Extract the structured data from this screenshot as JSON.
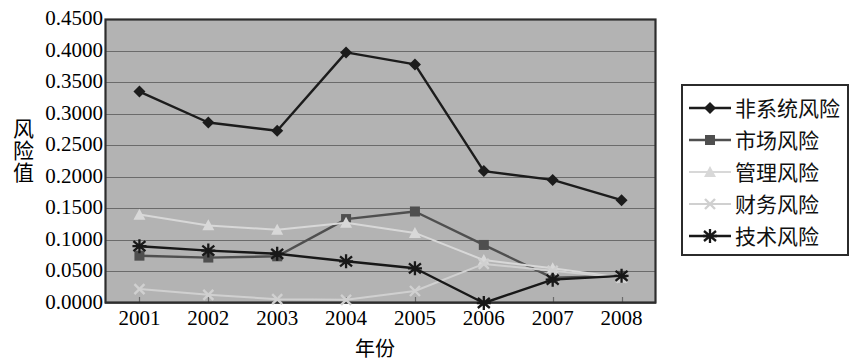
{
  "axes": {
    "y_label": "风险值",
    "x_label": "年份",
    "y_ticks": [
      "0.4500",
      "0.4000",
      "0.3500",
      "0.3000",
      "0.2500",
      "0.2000",
      "0.1500",
      "0.1000",
      "0.0500",
      "0.0000"
    ],
    "x_ticks": [
      "2001",
      "2002",
      "2003",
      "2004",
      "2005",
      "2006",
      "2007",
      "2008"
    ]
  },
  "legend": {
    "items": [
      {
        "label": "非系统风险",
        "marker": "diamond-marker",
        "color": "#1c1c1c"
      },
      {
        "label": "市场风险",
        "marker": "square-marker",
        "color": "#4f4f4f"
      },
      {
        "label": "管理风险",
        "marker": "triangle-marker",
        "color": "#d8d8d8"
      },
      {
        "label": "财务风险",
        "marker": "x-marker",
        "color": "#d0d0d0"
      },
      {
        "label": "技术风险",
        "marker": "star-marker",
        "color": "#181818"
      }
    ]
  },
  "colors": {
    "plot_background": "#b3b3b3",
    "plot_border": "#2d2d2d",
    "gridline": "#6b6b6b",
    "page_background": "#ffffff"
  },
  "chart_data": {
    "type": "line",
    "title": "",
    "xlabel": "年份",
    "ylabel": "风险值",
    "categories": [
      "2001",
      "2002",
      "2003",
      "2004",
      "2005",
      "2006",
      "2007",
      "2008"
    ],
    "ylim": [
      0.0,
      0.45
    ],
    "ytick_step": 0.05,
    "grid": true,
    "legend_position": "right",
    "series": [
      {
        "name": "非系统风险",
        "marker": "diamond",
        "color": "#1c1c1c",
        "values": [
          0.335,
          0.286,
          0.273,
          0.397,
          0.378,
          0.209,
          0.195,
          0.163
        ]
      },
      {
        "name": "市场风险",
        "marker": "square",
        "color": "#4f4f4f",
        "values": [
          0.075,
          0.072,
          0.074,
          0.133,
          0.145,
          0.092,
          0.04,
          0.043
        ]
      },
      {
        "name": "管理风险",
        "marker": "triangle",
        "color": "#d8d8d8",
        "values": [
          0.14,
          0.123,
          0.116,
          0.127,
          0.111,
          0.068,
          0.055,
          0.04
        ]
      },
      {
        "name": "财务风险",
        "marker": "x",
        "color": "#d0d0d0",
        "values": [
          0.022,
          0.013,
          0.006,
          0.005,
          0.019,
          0.062,
          0.051,
          0.04
        ]
      },
      {
        "name": "技术风险",
        "marker": "star",
        "color": "#181818",
        "values": [
          0.09,
          0.083,
          0.078,
          0.066,
          0.055,
          0.0,
          0.037,
          0.043
        ]
      }
    ]
  }
}
